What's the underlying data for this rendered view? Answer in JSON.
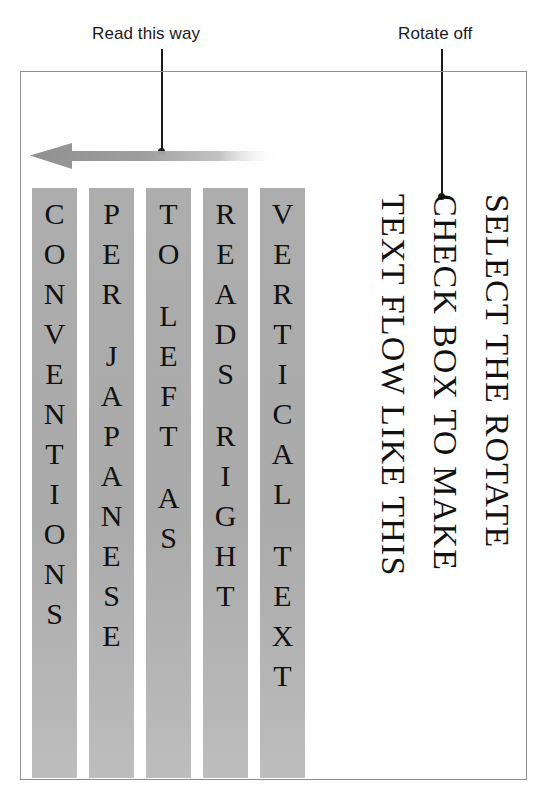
{
  "figure": {
    "background_color": "#ffffff",
    "frame_border_color": "#8d8d8d",
    "column_gray": "#adadad",
    "text_color": "#111111",
    "callout_color": "#1a1a1a"
  },
  "callouts": [
    {
      "id": "read-this-way",
      "label": "Read this way",
      "points_to": "gradient-arrow"
    },
    {
      "id": "rotate-off",
      "label": "Rotate off",
      "points_to": "rotated-paragraph"
    }
  ],
  "arrow": {
    "name": "gradient-arrow",
    "direction": "left",
    "meaning": "Read this way",
    "fill_start": "#9a9a9a",
    "fill_end": "#ffffff"
  },
  "vertical_columns": [
    {
      "index": 1,
      "text": "CONVENTIONS",
      "characters": [
        "C",
        "O",
        "N",
        "V",
        "E",
        "N",
        "T",
        "I",
        "O",
        "N",
        "S"
      ]
    },
    {
      "index": 2,
      "text": "PER JAPANESE",
      "characters": [
        "P",
        "E",
        "R",
        " ",
        "J",
        "A",
        "P",
        "A",
        "N",
        "E",
        "S",
        "E"
      ]
    },
    {
      "index": 3,
      "text": "TO LEFT AS",
      "characters": [
        "T",
        "O",
        " ",
        "L",
        "E",
        "F",
        "T",
        " ",
        "A",
        "S"
      ]
    },
    {
      "index": 4,
      "text": "READS RIGHT",
      "characters": [
        "R",
        "E",
        "A",
        "D",
        "S",
        " ",
        "R",
        "I",
        "G",
        "H",
        "T"
      ]
    },
    {
      "index": 5,
      "text": "VERTICAL TEXT",
      "characters": [
        "V",
        "E",
        "R",
        "T",
        "I",
        "C",
        "A",
        "L",
        " ",
        "T",
        "E",
        "X",
        "T"
      ]
    }
  ],
  "vertical_columns_reading_order": "right-to-left",
  "vertical_columns_sentence": "VERTICAL TEXT READS RIGHT TO LEFT AS PER JAPANESE CONVENTIONS",
  "rotated_paragraph": {
    "rotation_degrees": 90,
    "lines": [
      "SELECT THE ROTATE",
      "CHECK BOX TO MAKE",
      "TEXT FLOW LIKE THIS"
    ],
    "full_text": "SELECT THE ROTATE CHECK BOX TO MAKE TEXT FLOW LIKE THIS"
  }
}
